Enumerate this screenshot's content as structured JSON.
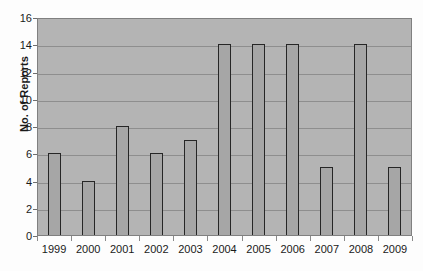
{
  "chart_data": {
    "type": "bar",
    "title": "",
    "xlabel": "",
    "ylabel": "No. of Reports",
    "categories": [
      "1999",
      "2000",
      "2001",
      "2002",
      "2003",
      "2004",
      "2005",
      "2006",
      "2007",
      "2008",
      "2009"
    ],
    "values": [
      6,
      4,
      8,
      6,
      7,
      14,
      14,
      14,
      5,
      14,
      5
    ],
    "ylim": [
      0,
      16
    ],
    "y_ticks": [
      0,
      2,
      4,
      6,
      8,
      10,
      12,
      14,
      16
    ],
    "grid": true,
    "legend": false,
    "colors": {
      "plot_background": "#b4b4b4",
      "bar_fill": "#a6a6a6",
      "bar_border": "#262626",
      "gridline": "#8e8e8e",
      "text": "#1a1a1a",
      "page_background": "#fdfdfd"
    }
  }
}
